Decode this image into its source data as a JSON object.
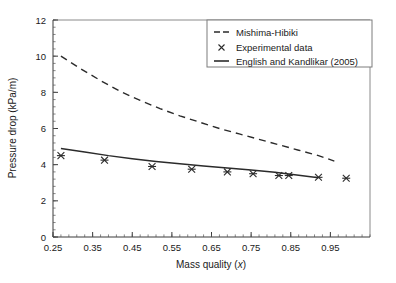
{
  "chart_data": {
    "type": "line",
    "title": "",
    "xlabel": "Mass quality (x)",
    "ylabel": "Pressure drop (kPa/m)",
    "xlim": [
      0.25,
      1.05
    ],
    "ylim": [
      0,
      12
    ],
    "xticks": [
      0.25,
      0.35,
      0.45,
      0.55,
      0.65,
      0.75,
      0.85,
      0.95
    ],
    "xticklabels": [
      "0.25",
      "0.35",
      "0.45",
      "0.55",
      "0.65",
      "0.75",
      "0.85",
      "0.95"
    ],
    "yticks": [
      0,
      2,
      4,
      6,
      8,
      10,
      12
    ],
    "yticklabels": [
      "0",
      "2",
      "4",
      "6",
      "8",
      "10",
      "12"
    ],
    "x_minor_ticks_per_major": 5,
    "y_minor_ticks_per_major": 5,
    "grid": false,
    "legend_position": "top-right",
    "series": [
      {
        "name": "Mishima-Hibiki",
        "style": "dashed",
        "color": "#2b2b2b",
        "x": [
          0.27,
          0.32,
          0.37,
          0.42,
          0.47,
          0.52,
          0.57,
          0.62,
          0.67,
          0.72,
          0.77,
          0.82,
          0.87,
          0.92,
          0.96
        ],
        "values": [
          10.0,
          9.3,
          8.65,
          8.05,
          7.55,
          7.1,
          6.7,
          6.35,
          6.0,
          5.7,
          5.4,
          5.1,
          4.8,
          4.5,
          4.2
        ]
      },
      {
        "name": "Experimental data",
        "style": "markers",
        "marker": "x",
        "color": "#2b2b2b",
        "x": [
          0.27,
          0.38,
          0.5,
          0.6,
          0.69,
          0.755,
          0.82,
          0.845,
          0.92,
          0.99
        ],
        "values": [
          4.5,
          4.25,
          3.9,
          3.75,
          3.6,
          3.5,
          3.4,
          3.4,
          3.3,
          3.25
        ]
      },
      {
        "name": "English and Kandlikar (2005)",
        "style": "solid",
        "color": "#2b2b2b",
        "x": [
          0.27,
          0.33,
          0.39,
          0.45,
          0.51,
          0.57,
          0.63,
          0.69,
          0.75,
          0.81,
          0.87,
          0.92
        ],
        "values": [
          4.9,
          4.7,
          4.5,
          4.33,
          4.18,
          4.05,
          3.93,
          3.82,
          3.7,
          3.58,
          3.42,
          3.28
        ]
      }
    ]
  },
  "legend": {
    "items": [
      {
        "label": "Mishima-Hibiki",
        "style": "dashed"
      },
      {
        "label": "Experimental data",
        "style": "marker"
      },
      {
        "label": "English and Kandlikar (2005)",
        "style": "solid"
      }
    ]
  },
  "axes": {
    "x_title_main": "Mass quality (",
    "x_title_var": "x",
    "x_title_close": ")",
    "y_title": "Pressure drop (kPa/m)"
  }
}
